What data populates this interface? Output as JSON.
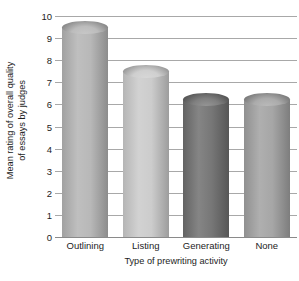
{
  "chart_data": {
    "type": "bar",
    "title": "",
    "subtitle": "",
    "xlabel": "Type of prewriting activity",
    "ylabel": "Mean rating of overall quality of essays by judges",
    "ylabel_line1": "Mean rating of overall quality",
    "ylabel_line2": "of essays by judges",
    "categories": [
      "Outlining",
      "Listing",
      "Generating",
      "None"
    ],
    "values": [
      9.5,
      7.5,
      6.2,
      6.2
    ],
    "ylim": [
      0,
      10
    ],
    "ytick_labels": [
      "0",
      "1",
      "2",
      "3",
      "4",
      "5",
      "6",
      "7",
      "8",
      "9",
      "10"
    ],
    "ytick_values": [
      0,
      1,
      2,
      3,
      4,
      5,
      6,
      7,
      8,
      9,
      10
    ],
    "grid": true,
    "grid_color": "#a8a8a8",
    "legend": "none",
    "bar_style": "3d-cylinder",
    "bar_colors": [
      "#b3b3b3",
      "#c9c9c9",
      "#6e6e6e",
      "#a0a0a0"
    ],
    "background_color": "#ffffff",
    "text_color": "#1d1d1d"
  }
}
